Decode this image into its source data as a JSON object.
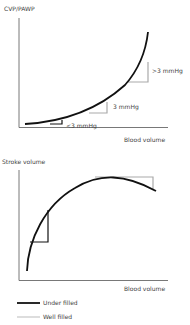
{
  "colors": {
    "under_filled": "#111111",
    "well_filled": "#aaaaaa",
    "axis": "#444444",
    "text": "#444444"
  },
  "top_chart": {
    "y_label": "CVP/PAWP",
    "x_label": "Blood volume",
    "annotations": [
      ">3 mmHg",
      "3 mmHg",
      "<3 mmHg"
    ]
  },
  "bottom_chart": {
    "y_label": "Stroke volume",
    "x_label": "Blood volume"
  },
  "legend": {
    "items": [
      {
        "label": "Under filled",
        "color": "#111111"
      },
      {
        "label": "Well filled",
        "color": "#aaaaaa"
      }
    ]
  }
}
